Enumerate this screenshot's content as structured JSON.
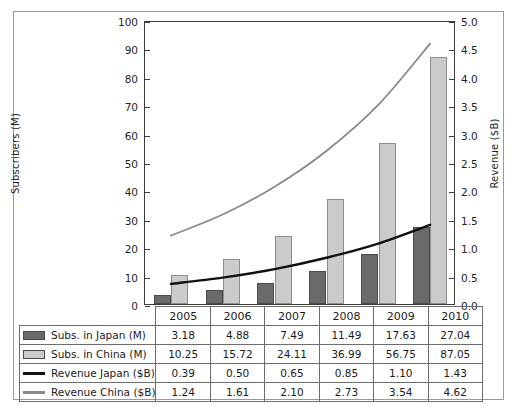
{
  "chart_data": {
    "type": "bar",
    "title": "",
    "xlabel": "",
    "ylabel": "Subscribers (M)",
    "y2label": "Revenue ($B)",
    "categories": [
      "2005",
      "2006",
      "2007",
      "2008",
      "2009",
      "2010"
    ],
    "ylim": [
      0,
      100
    ],
    "y2lim": [
      0,
      5.0
    ],
    "yticks": [
      0,
      10,
      20,
      30,
      40,
      50,
      60,
      70,
      80,
      90,
      100
    ],
    "ytick_labels": [
      "0",
      "10",
      "20",
      "30",
      "40",
      "50",
      "60",
      "70",
      "80",
      "90",
      "100"
    ],
    "y2ticks": [
      0.0,
      0.5,
      1.0,
      1.5,
      2.0,
      2.5,
      3.0,
      3.5,
      4.0,
      4.5,
      5.0
    ],
    "y2tick_labels": [
      "0.0",
      "0.5",
      "1.0",
      "1.5",
      "2.0",
      "2.5",
      "3.0",
      "3.5",
      "4.0",
      "4.5",
      "5.0"
    ],
    "grid": false,
    "legend_position": "table-below",
    "series": [
      {
        "name": "Subs. in Japan (M)",
        "kind": "bar",
        "axis": "left",
        "color": "#6a6a6a",
        "values": [
          3.18,
          4.88,
          7.49,
          11.49,
          17.63,
          27.04
        ]
      },
      {
        "name": "Subs. in China (M)",
        "kind": "bar",
        "axis": "left",
        "color": "#cbcbcb",
        "values": [
          10.25,
          15.72,
          24.11,
          36.99,
          56.75,
          87.05
        ]
      },
      {
        "name": "Revenue Japan ($B)",
        "kind": "line",
        "axis": "right",
        "color": "#101010",
        "values": [
          0.39,
          0.5,
          0.65,
          0.85,
          1.1,
          1.43
        ]
      },
      {
        "name": "Revenue China ($B)",
        "kind": "line",
        "axis": "right",
        "color": "#8a8a8a",
        "values": [
          1.24,
          1.61,
          2.1,
          2.73,
          3.54,
          4.62
        ]
      }
    ]
  },
  "table": {
    "corner_label": "",
    "year_headers": [
      "2005",
      "2006",
      "2007",
      "2008",
      "2009",
      "2010"
    ],
    "rows": [
      {
        "label": "Subs. in Japan (M)",
        "swatch": "dark-box-swatch",
        "cells": [
          "3.18",
          "4.88",
          "7.49",
          "11.49",
          "17.63",
          "27.04"
        ]
      },
      {
        "label": "Subs. in China (M)",
        "swatch": "light-box-swatch",
        "cells": [
          "10.25",
          "15.72",
          "24.11",
          "36.99",
          "56.75",
          "87.05"
        ]
      },
      {
        "label": "Revenue Japan ($B)",
        "swatch": "black-line-swatch",
        "cells": [
          "0.39",
          "0.50",
          "0.65",
          "0.85",
          "1.10",
          "1.43"
        ]
      },
      {
        "label": "Revenue China ($B)",
        "swatch": "gray-line-swatch",
        "cells": [
          "1.24",
          "1.61",
          "2.10",
          "2.73",
          "3.54",
          "4.62"
        ]
      }
    ]
  }
}
